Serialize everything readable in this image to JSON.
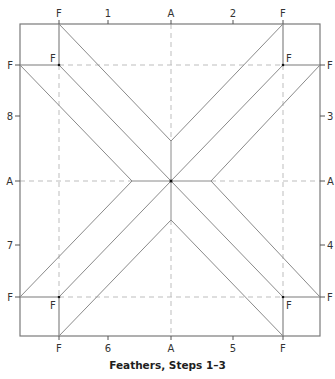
{
  "caption": "Feathers, Steps 1–3",
  "colors": {
    "solid_line": "#7a7a7a",
    "dashed_line": "#bdbdbd",
    "label": "#333333",
    "dot": "#111111"
  },
  "labels": {
    "top": [
      "F",
      "1",
      "A",
      "2",
      "F"
    ],
    "bottom": [
      "F",
      "6",
      "A",
      "5",
      "F"
    ],
    "left": [
      "F",
      "8",
      "A",
      "7",
      "F"
    ],
    "right": [
      "F",
      "3",
      "A",
      "4",
      "F"
    ],
    "inner": [
      "F",
      "F",
      "F",
      "F"
    ]
  }
}
